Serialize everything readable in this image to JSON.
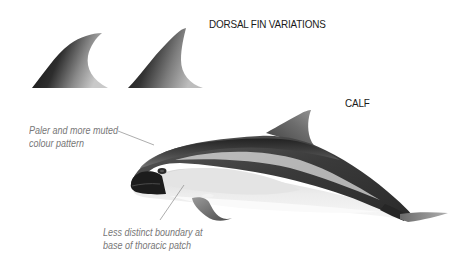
{
  "title": "DORSAL FIN VARIATIONS",
  "subject_label": "CALF",
  "annotations": {
    "colour": {
      "line1": "Paler and more muted",
      "line2": "colour pattern"
    },
    "boundary": {
      "line1": "Less distinct boundary at",
      "line2": "base of thoracic patch"
    }
  },
  "figures": {
    "fin_variations": [
      "falcate-dorsal-fin",
      "triangular-dorsal-fin"
    ],
    "main": "porpoise-calf-lateral-view"
  },
  "colors": {
    "background": "#ffffff",
    "dark_body": "#2a2a2a",
    "mid_grey": "#7a7a7a",
    "pale_belly": "#e6e6e6",
    "annotation_text": "#777777",
    "heading_text": "#1a1a1a"
  }
}
